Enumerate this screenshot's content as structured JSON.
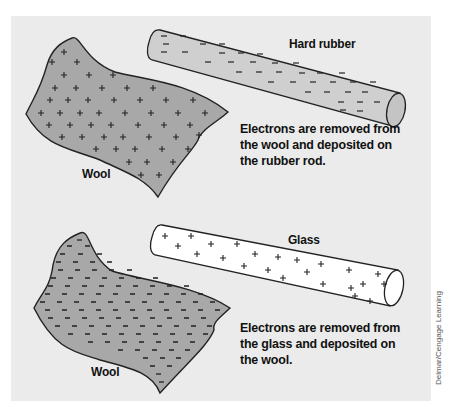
{
  "figure": {
    "top_panel": {
      "cloth_label": "Wool",
      "cloth_charge": "positive",
      "cloth_symbol": "+",
      "rod_label": "Hard rubber",
      "rod_charge": "negative",
      "rod_symbol": "−",
      "caption_lines": [
        "Electrons are removed from",
        "the wool and deposited on",
        "the rubber rod."
      ]
    },
    "bottom_panel": {
      "cloth_label": "Wool",
      "cloth_charge": "negative",
      "cloth_symbol": "−",
      "rod_label": "Glass",
      "rod_charge": "positive",
      "rod_symbol": "+",
      "caption_lines": [
        "Electrons are removed from",
        "the glass and deposited on",
        "the wool."
      ]
    },
    "credit": "Delmar/Cengage Learning",
    "colors": {
      "background": "#ebebeb",
      "cloth_fill": "#a8a8a8",
      "rubber_rod_fill": "#cfcfcf",
      "glass_rod_fill": "#ffffff",
      "outline": "#222222"
    }
  }
}
